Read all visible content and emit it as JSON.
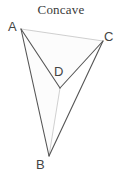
{
  "figure": {
    "title": "Concave",
    "type": "polygon-diagram",
    "shape": "concave quadrilateral (dart)",
    "canvas": {
      "width": 122,
      "height": 180,
      "background": "#ffffff"
    },
    "style": {
      "solid_edge_color": "#555555",
      "solid_edge_width": 1.1,
      "faint_edge_color": "#c9c9c9",
      "faint_edge_width": 0.9,
      "fill_color": "#fcfcfc",
      "label_color": "#444444",
      "title_color": "#3a3a3a"
    },
    "vertices": [
      {
        "id": "A",
        "label": "A",
        "x": 21,
        "y": 29
      },
      {
        "id": "C",
        "label": "C",
        "x": 103,
        "y": 41
      },
      {
        "id": "D",
        "label": "D",
        "x": 60,
        "y": 88
      },
      {
        "id": "B",
        "label": "B",
        "x": 49,
        "y": 156
      }
    ],
    "outline_order": [
      "A",
      "C",
      "D",
      "B"
    ],
    "edges": [
      {
        "from": "A",
        "to": "D",
        "style": "solid"
      },
      {
        "from": "C",
        "to": "D",
        "style": "solid"
      },
      {
        "from": "A",
        "to": "B",
        "style": "solid"
      },
      {
        "from": "C",
        "to": "B",
        "style": "solid"
      },
      {
        "from": "A",
        "to": "C",
        "style": "faint"
      },
      {
        "from": "D",
        "to": "B",
        "style": "faint"
      }
    ]
  }
}
